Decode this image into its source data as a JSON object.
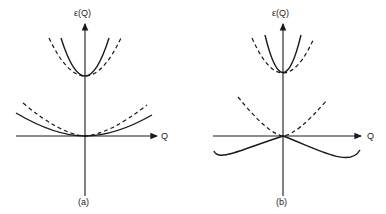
{
  "panels": [
    {
      "id": "a",
      "caption": "(a)",
      "y_axis_label": "ε(Q)",
      "x_axis_label": "Q",
      "curves": [
        {
          "branch": "upper",
          "style": "solid",
          "description": "narrow parabola, minimum at gap on energy axis"
        },
        {
          "branch": "upper",
          "style": "dashed",
          "description": "wider parabola, same minimum"
        },
        {
          "branch": "lower",
          "style": "solid",
          "description": "shallow parabola starting at origin"
        },
        {
          "branch": "lower",
          "style": "dashed",
          "description": "slightly steeper parabola starting at origin"
        }
      ]
    },
    {
      "id": "b",
      "caption": "(b)",
      "y_axis_label": "ε(Q)",
      "x_axis_label": "Q",
      "curves": [
        {
          "branch": "upper",
          "style": "solid",
          "description": "narrow parabola, minimum at gap on energy axis"
        },
        {
          "branch": "upper",
          "style": "dashed",
          "description": "wider parabola, same minimum"
        },
        {
          "branch": "lower",
          "style": "solid",
          "description": "curve bending below Q axis (negative energy) with minima at large |Q|"
        },
        {
          "branch": "lower",
          "style": "dashed",
          "description": "steep parabola starting at origin"
        }
      ]
    }
  ]
}
